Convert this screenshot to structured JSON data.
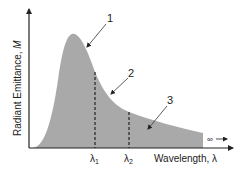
{
  "diagram": {
    "type": "blackbody-radiation-curve",
    "y_axis_label_text": "Radiant Emittance, ",
    "y_axis_label_var": "M",
    "x_axis_label_text": "Wavelength, ",
    "x_axis_label_var": "λ",
    "region_labels": [
      "1",
      "2",
      "3"
    ],
    "markers": [
      {
        "symbol": "λ",
        "subscript": "1"
      },
      {
        "symbol": "λ",
        "subscript": "2"
      }
    ],
    "infinity_label": "∞",
    "colors": {
      "fill": "#a9a9a9",
      "axis": "#222222",
      "dashed": "#222222",
      "text": "#222222"
    }
  }
}
